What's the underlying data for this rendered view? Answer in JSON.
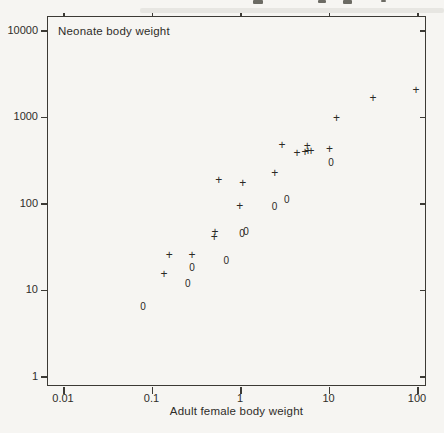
{
  "figure": {
    "inner_label": "Neonate body weight",
    "xlabel": "Adult female body weight"
  },
  "colors": {
    "ink": "#34322e",
    "paper": "#f6f5f2"
  },
  "chart_data": {
    "type": "scatter",
    "title": "",
    "xlabel": "Adult female body weight",
    "ylabel_inner": "Neonate body weight",
    "x_scale": "log",
    "y_scale": "log",
    "xlim": [
      0.0066,
      126
    ],
    "ylim": [
      0.77,
      14500
    ],
    "x_ticks": [
      0.01,
      0.1,
      1,
      10,
      100
    ],
    "x_tick_labels": [
      "0.01",
      "0.1",
      "1",
      "10",
      "100"
    ],
    "y_ticks": [
      1,
      10,
      100,
      1000,
      10000
    ],
    "y_tick_labels": [
      "1",
      "10",
      "100",
      "1000",
      "10000"
    ],
    "grid": false,
    "legend": false,
    "series": [
      {
        "name": "plus-markers",
        "marker": "+",
        "points": [
          [
            95,
            2100
          ],
          [
            31,
            1700
          ],
          [
            12,
            1000
          ],
          [
            10,
            430
          ],
          [
            6.2,
            410
          ],
          [
            5.7,
            410
          ],
          [
            5.6,
            470
          ],
          [
            5.3,
            400
          ],
          [
            4.3,
            390
          ],
          [
            2.9,
            480
          ],
          [
            2.4,
            230
          ],
          [
            1.05,
            175
          ],
          [
            0.97,
            95
          ],
          [
            0.56,
            190
          ],
          [
            0.51,
            47
          ],
          [
            0.5,
            42
          ],
          [
            0.28,
            26
          ],
          [
            0.155,
            26
          ],
          [
            0.135,
            15.5
          ]
        ]
      },
      {
        "name": "circle-markers",
        "marker": "0",
        "points": [
          [
            10.4,
            300
          ],
          [
            3.3,
            110
          ],
          [
            2.4,
            92
          ],
          [
            1.14,
            48
          ],
          [
            1.03,
            45
          ],
          [
            0.68,
            22
          ],
          [
            0.28,
            18
          ],
          [
            0.25,
            12
          ],
          [
            0.078,
            6.5
          ]
        ]
      }
    ]
  }
}
